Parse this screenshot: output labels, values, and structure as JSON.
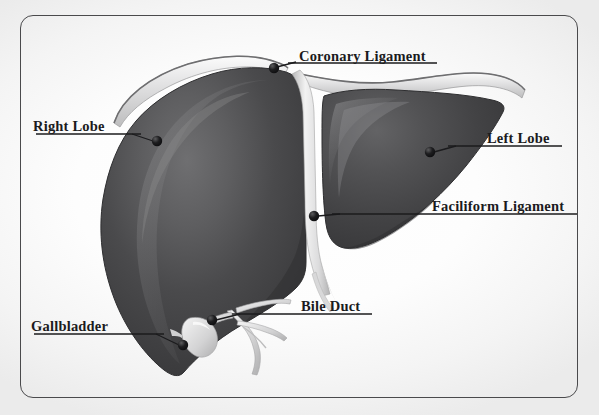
{
  "diagram": {
    "background_color": "#ffffff",
    "frame_color": "#4a4a4c",
    "organ_dark_color": "#3a3a3c",
    "organ_mid_color": "#565658",
    "organ_light_color": "#7c7c7e",
    "ligament_color": "#d9d9da",
    "marker_color": "#111113",
    "leader_color": "#1b1b1d",
    "labels": [
      {
        "id": "coronary-ligament",
        "text": "Coronary Ligament"
      },
      {
        "id": "right-lobe",
        "text": "Right Lobe"
      },
      {
        "id": "left-lobe",
        "text": "Left Lobe"
      },
      {
        "id": "faciliform-ligament",
        "text": "Faciliform Ligament"
      },
      {
        "id": "bile-duct",
        "text": "Bile Duct"
      },
      {
        "id": "gallbladder",
        "text": "Gallbladder"
      }
    ]
  }
}
